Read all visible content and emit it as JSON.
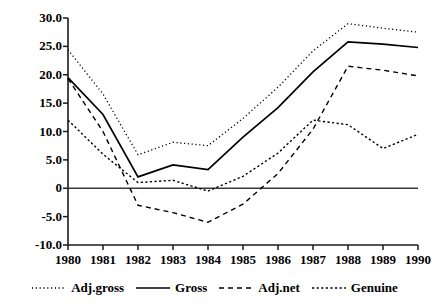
{
  "chart_data": {
    "type": "line",
    "title": "",
    "xlabel": "",
    "ylabel": "Per cent of GNP",
    "x": [
      1980,
      1981,
      1982,
      1983,
      1984,
      1985,
      1986,
      1987,
      1988,
      1989,
      1990
    ],
    "categories": [
      "1980",
      "1981",
      "1982",
      "1983",
      "1984",
      "1985",
      "1986",
      "1987",
      "1988",
      "1989",
      "1990"
    ],
    "xlim": [
      1980,
      1990
    ],
    "ylim": [
      -10.0,
      30.0
    ],
    "ytick_values": [
      30.0,
      25.0,
      20.0,
      15.0,
      10.0,
      5.0,
      0,
      -5.0,
      -10.0
    ],
    "ytick_labels": [
      "30.0",
      "25.0",
      "20.0",
      "15.0",
      "10.0",
      "5.0",
      "0",
      "-5.0",
      "-10.0"
    ],
    "grid": false,
    "zero_line": true,
    "legend_position": "bottom",
    "series": [
      {
        "name": "Adj.gross",
        "style": "dotted",
        "color": "#000000",
        "values": [
          24.4,
          16.6,
          5.9,
          8.1,
          7.5,
          12.3,
          17.8,
          24.2,
          29.0,
          28.2,
          27.5
        ]
      },
      {
        "name": "Gross",
        "style": "solid",
        "color": "#000000",
        "values": [
          19.5,
          13.0,
          2.0,
          4.1,
          3.3,
          9.0,
          14.2,
          20.5,
          25.8,
          25.4,
          24.8
        ]
      },
      {
        "name": "Adj.net",
        "style": "dashed",
        "color": "#000000",
        "values": [
          19.3,
          10.0,
          -3.0,
          -4.3,
          -6.0,
          -2.8,
          2.6,
          10.4,
          21.5,
          20.8,
          19.8
        ]
      },
      {
        "name": "Genuine",
        "style": "fine-dotted",
        "color": "#000000",
        "values": [
          12.0,
          6.0,
          1.0,
          1.4,
          -0.5,
          2.1,
          6.2,
          12.0,
          11.2,
          7.0,
          9.5
        ]
      }
    ]
  },
  "axes": {
    "y_axis_label": "Per cent of GNP"
  },
  "legend": {
    "items": [
      {
        "label": "Adj.gross",
        "style": "dotted"
      },
      {
        "label": "Gross",
        "style": "solid"
      },
      {
        "label": "Adj.net",
        "style": "dashed"
      },
      {
        "label": "Genuine",
        "style": "fine-dotted"
      }
    ]
  }
}
